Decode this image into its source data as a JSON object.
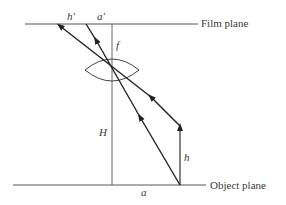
{
  "diagram": {
    "labels": {
      "film_plane": "Film plane",
      "object_plane": "Object plane",
      "h_prime": "h'",
      "a_prime": "a'",
      "f": "f",
      "H": "H",
      "h": "h",
      "a": "a"
    },
    "colors": {
      "line": "#333333",
      "text": "#3a3a3a",
      "background": "#ffffff"
    }
  }
}
